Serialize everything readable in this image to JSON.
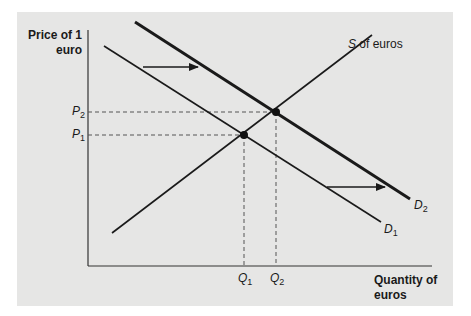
{
  "diagram": {
    "type": "supply-demand",
    "title": "",
    "y_axis_label_line1": "Price of 1",
    "y_axis_label_line2": "euro",
    "x_axis_label_line1": "Quantity of",
    "x_axis_label_line2": "euros",
    "supply_label_var": "S",
    "supply_label_rest": " of euros",
    "demand_labels": [
      {
        "var": "D",
        "sub": "1"
      },
      {
        "var": "D",
        "sub": "2"
      }
    ],
    "price_labels": [
      {
        "var": "P",
        "sub": "2"
      },
      {
        "var": "P",
        "sub": "1"
      }
    ],
    "quantity_labels": [
      {
        "var": "Q",
        "sub": "1"
      },
      {
        "var": "Q",
        "sub": "2"
      }
    ],
    "colors": {
      "panel": "#e6e6e5",
      "ink": "#1a1a1a",
      "dash": "#555555"
    },
    "curves": {
      "supply": {
        "from": [
          112,
          233
        ],
        "to": [
          372,
          35
        ]
      },
      "demand_1": {
        "from": [
          104,
          46
        ],
        "to": [
          381,
          222
        ]
      },
      "demand_2": {
        "from": [
          135,
          22
        ],
        "to": [
          410,
          199
        ]
      }
    },
    "equilibria": [
      {
        "name": "E1",
        "x": 244,
        "y": 135
      },
      {
        "name": "E2",
        "x": 276,
        "y": 112
      }
    ],
    "shift_arrows": [
      {
        "from": [
          143,
          67
        ],
        "to": [
          198,
          67
        ]
      },
      {
        "from": [
          327,
          187
        ],
        "to": [
          385,
          187
        ]
      }
    ]
  }
}
